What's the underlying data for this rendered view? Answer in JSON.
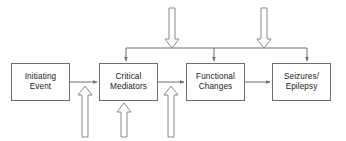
{
  "diagram": {
    "background_color": "#ffffff",
    "line_color": "#6f6f6f",
    "text_color": "#1a1a1a",
    "arrow_fill": "#ffffff",
    "nodes": [
      {
        "id": "initiating-event",
        "label": "Initiating\nEvent",
        "x": 11,
        "y": 63,
        "w": 59,
        "h": 38
      },
      {
        "id": "critical-mediators",
        "label": "Critical\nMediators",
        "x": 99,
        "y": 63,
        "w": 59,
        "h": 38
      },
      {
        "id": "functional-changes",
        "label": "Functional\nChanges",
        "x": 186,
        "y": 63,
        "w": 59,
        "h": 38
      },
      {
        "id": "seizures-epilepsy",
        "label": "Seizures/\nEpilepsy",
        "x": 272,
        "y": 63,
        "w": 59,
        "h": 38
      }
    ],
    "flow_arrows": [
      {
        "id": "initiating-to-mediators",
        "from": "initiating-event",
        "to": "critical-mediators"
      },
      {
        "id": "mediators-to-functional",
        "from": "critical-mediators",
        "to": "functional-changes"
      },
      {
        "id": "functional-to-seizures",
        "from": "functional-changes",
        "to": "seizures-epilepsy"
      }
    ],
    "bus": {
      "id": "distribution-bus",
      "y": 48,
      "x_left": 126,
      "x_right": 307,
      "drop_targets": [
        126,
        214,
        307
      ]
    },
    "input_arrows_top": [
      {
        "id": "top-input-1",
        "x": 172,
        "y_start": 8,
        "y_tip": 48
      },
      {
        "id": "top-input-2",
        "x": 264,
        "y_start": 8,
        "y_tip": 48
      }
    ],
    "input_arrows_bottom": [
      {
        "id": "bottom-input-1",
        "x": 85,
        "y_start": 137,
        "y_tip": 86
      },
      {
        "id": "bottom-input-2",
        "x": 124,
        "y_start": 137,
        "y_tip": 103
      },
      {
        "id": "bottom-input-3",
        "x": 171,
        "y_start": 137,
        "y_tip": 86
      }
    ]
  }
}
